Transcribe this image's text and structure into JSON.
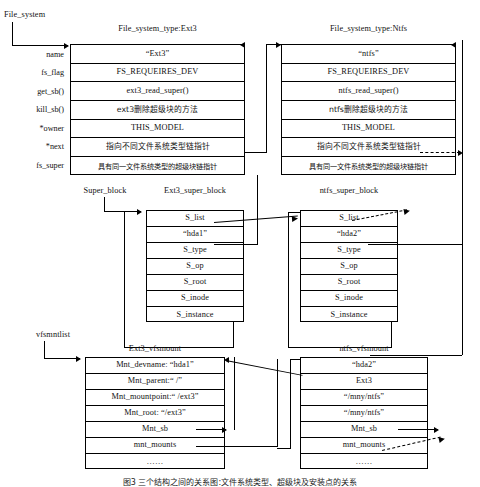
{
  "figure": {
    "root_label": "File_system",
    "caption": "图3    三个结构之间的关系图:文件系统类型、超级块及安装点的关系"
  },
  "fs_type_field_labels": [
    "name",
    "fs_flag",
    "get_sb()",
    "kill_sb()",
    "*owner",
    "*next",
    "fs_super"
  ],
  "ext3_fs_type": {
    "title": "File_system_type:Ext3",
    "rows": [
      "“Ext3”",
      "FS_REQUEIRES_DEV",
      "ext3_read_super()",
      "ext3删除超级块的方法",
      "THIS_MODEL",
      "指向不同文件系统类型链指针",
      "具有同一文件系统类型的超级块链指针"
    ]
  },
  "ntfs_fs_type": {
    "title": "File_system_type:Ntfs",
    "rows": [
      "“ntfs”",
      "FS_REQUEIRES_DEV",
      "ntfs_read_super()",
      "ntfs删除超级块的方法",
      "THIS_MODEL",
      "指向不同文件系统类型链指针",
      "具有同一文件系统类型的超级块链指针"
    ]
  },
  "super_block_list_label": "Super_block",
  "ext3_super_block": {
    "title": "Ext3_super_block",
    "rows": [
      "S_list",
      "“hda1”",
      "S_type",
      "S_op",
      "S_root",
      "S_inode",
      "S_instance"
    ]
  },
  "ntfs_super_block": {
    "title": "ntfs_super_block",
    "rows": [
      "S_list",
      "“hda2”",
      "S_type",
      "S_op",
      "S_root",
      "S_inode",
      "S_instance"
    ]
  },
  "vfsmnt_list_label": "vfsmntlist",
  "ext3_vfsmount": {
    "title": "Ext3_vfsmount",
    "rows": [
      "Mnt_devname:  “hda1”",
      "Mnt_parent:“  /”",
      "Mnt_mountpoint:“  /ext3”",
      "Mnt_root:  “/ext3”",
      "Mnt_sb",
      "mnt_mounts",
      "……"
    ]
  },
  "ntfs_vfsmount": {
    "title": "ntfs_vfsmount",
    "rows": [
      "“hda2”",
      "Ext3",
      "“/mny/ntfs”",
      "“/mny/ntfs”",
      "Mnt_sb",
      "mnt_mounts",
      "……"
    ]
  }
}
